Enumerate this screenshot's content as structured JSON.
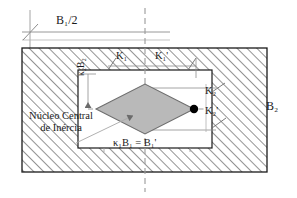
{
  "diagram": {
    "language": "pt-BR",
    "labels": {
      "b1_half": "B₁/2",
      "k1_left": "K₁",
      "k1_right": "K₁'",
      "k2_upper": "K₂",
      "k2_lower": "K₂'",
      "b2_right": "B₂",
      "kappa2_b2": "κ₂B₂",
      "kappa1_b1_eq": "κ₁B₁ = B₁'",
      "nucleo_line1": "Núcleo Central",
      "nucleo_line2": "de Inércia"
    },
    "colors": {
      "stroke": "#1a1a1a",
      "hatch": "#3a3a3a",
      "diamond_fill": "#b9b9b9",
      "diamond_stroke": "#6e6e6e",
      "dashed_axis": "#9a9a9a",
      "dim_line": "#8d8d8d",
      "inner_fill": "#ffffff",
      "page_bg": "#ffffff",
      "point_fill": "#000000"
    },
    "geometry": {
      "outer_rect": {
        "x": 22,
        "y": 48,
        "w": 245,
        "h": 124
      },
      "inner_rect": {
        "x": 78,
        "y": 70,
        "w": 134,
        "h": 78
      },
      "center": {
        "x": 145,
        "y": 109
      },
      "diamond": {
        "left": {
          "x": 96,
          "y": 109
        },
        "right": {
          "x": 194,
          "y": 109
        },
        "top": {
          "x": 145,
          "y": 84
        },
        "bottom": {
          "x": 145,
          "y": 134
        }
      },
      "point_marker": {
        "x": 194,
        "y": 109,
        "r": 4
      },
      "vertical_axis_x": 145,
      "horizontal_axis_y": 109
    }
  }
}
